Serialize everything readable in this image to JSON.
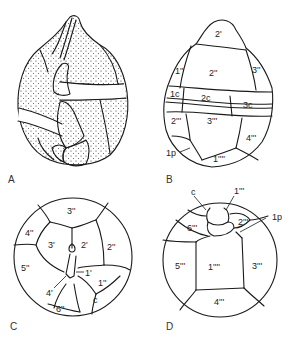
{
  "figure": {
    "panels": [
      {
        "id": "A",
        "label": "A",
        "description": "ventral view, stippled theca with girdle"
      },
      {
        "id": "B",
        "label": "B",
        "description": "plate tabulation, ventral-lateral view"
      },
      {
        "id": "C",
        "label": "C",
        "description": "apical view"
      },
      {
        "id": "D",
        "label": "D",
        "description": "antapical view"
      }
    ],
    "panel_B_labels": {
      "p2a": "2'",
      "p2pp": "2''",
      "p1pp": "1''",
      "p3pp": "3''",
      "c1": "1c",
      "c2": "2c",
      "c3": "3c",
      "p2ppp": "2'''",
      "p3ppp": "3'''",
      "p4ppp": "4'''",
      "p1pppp": "1''''",
      "p1p": "1p"
    },
    "panel_C_labels": {
      "p3pp": "3''",
      "p4pp": "4''",
      "p3a": "3'",
      "p2a": "2'",
      "p2pp": "2''",
      "p5pp": "5''",
      "p1a": "1'",
      "p1pp": "1''",
      "p4a": "4'",
      "p6pp": "6''",
      "c": "c"
    },
    "panel_D_labels": {
      "c": "c",
      "p1ppp": "1'''",
      "p2ppp": "2'''",
      "p1p": "1p",
      "p6ppp": "6'''",
      "p5ppp": "5'''",
      "p1pppp": "1''''",
      "p3ppp": "3'''",
      "p4ppp": "4'''"
    }
  }
}
